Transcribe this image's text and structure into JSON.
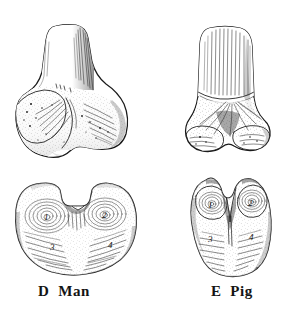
{
  "plate": {
    "background_color": "#ffffff",
    "ink_color": "#1a1a1a",
    "medium": "line engraving / stipple illustration",
    "subject": "comparative bone anatomy plate"
  },
  "figures": [
    {
      "key": "d_man",
      "letter": "D",
      "name": "Man",
      "caption": "D  Man",
      "views": [
        {
          "key": "d_man_upper",
          "orientation": "anterior view with shaft",
          "description": "bone with tapering rounded shaft above a broad articular condyle"
        },
        {
          "key": "d_man_lower",
          "orientation": "distal articular surface view",
          "description": "broad heart-shaped articular surface with central notch"
        }
      ],
      "cusp_labels": [
        "1",
        "2",
        "3",
        "4"
      ]
    },
    {
      "key": "e_pig",
      "letter": "E",
      "name": "Pig",
      "caption": "E  Pig",
      "views": [
        {
          "key": "e_pig_upper",
          "orientation": "anterior view with shaft",
          "description": "narrow vertically hatched shaft above two lobed condyles"
        },
        {
          "key": "e_pig_lower",
          "orientation": "distal articular surface view",
          "description": "narrow four-lobed articular surface with deep median cleft"
        }
      ],
      "cusp_labels": [
        "1",
        "2",
        "3",
        "4"
      ]
    }
  ],
  "captions": {
    "left": "D  Man",
    "right": "E  Pig"
  },
  "cusp_numbers": {
    "man_lower": {
      "n1": "1",
      "n2": "2",
      "n3": "3",
      "n4": "4"
    },
    "pig_lower": {
      "n1": "1",
      "n2": "2",
      "n3": "3",
      "n4": "4"
    }
  }
}
